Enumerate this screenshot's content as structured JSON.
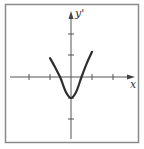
{
  "chart_data": {
    "type": "line",
    "title": "",
    "xlabel": "x",
    "ylabel": "y'",
    "grid": false,
    "legend": null,
    "xlim": [
      -3,
      3
    ],
    "ylim": [
      -3,
      3
    ],
    "x_ticks": [
      -2,
      -1,
      1,
      2
    ],
    "y_ticks": [
      -2,
      -1,
      1,
      2
    ],
    "tick_labels_shown": false,
    "series": [
      {
        "name": "y'",
        "x": [
          -1.0,
          -0.75,
          -0.5,
          -0.25,
          0.0,
          0.25,
          0.5,
          0.75,
          1.0
        ],
        "y": [
          0.9,
          0.45,
          -0.05,
          -0.7,
          -1.0,
          -0.7,
          0.0,
          0.65,
          1.2
        ]
      }
    ]
  },
  "labels": {
    "x_axis": "x",
    "y_axis": "y'"
  },
  "colors": {
    "axis": "#555555",
    "curve": "#333333",
    "frame": "#888888"
  }
}
